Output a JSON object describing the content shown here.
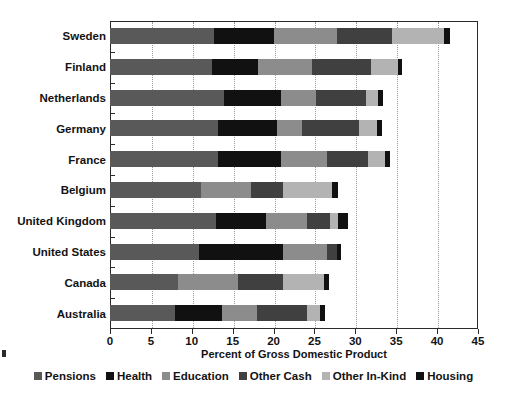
{
  "chart_data": {
    "type": "bar",
    "orientation": "horizontal",
    "stacked": true,
    "title": "",
    "xlabel": "Percent of Gross Domestic Product",
    "ylabel": "",
    "xlim": [
      0,
      45
    ],
    "xticks": [
      0,
      5,
      10,
      15,
      20,
      25,
      30,
      35,
      40,
      45
    ],
    "grid": "vertical-dotted",
    "legend_position": "bottom",
    "categories": [
      "Sweden",
      "Finland",
      "Netherlands",
      "Germany",
      "France",
      "Belgium",
      "United Kingdom",
      "United States",
      "Canada",
      "Australia"
    ],
    "series": [
      {
        "name": "Pensions",
        "color": "#595959",
        "values": [
          12.7,
          12.5,
          13.9,
          13.2,
          13.2,
          11.1,
          13.0,
          10.9,
          8.3,
          8.0
        ]
      },
      {
        "name": "Health",
        "color": "#111111",
        "values": [
          7.3,
          5.6,
          7.0,
          7.2,
          7.7,
          0.0,
          6.1,
          10.2,
          0.0,
          5.7
        ]
      },
      {
        "name": "Education",
        "color": "#8c8c8c",
        "values": [
          7.8,
          6.6,
          4.3,
          3.1,
          5.6,
          6.1,
          5.0,
          5.4,
          7.3,
          4.3
        ]
      },
      {
        "name": "Other Cash",
        "color": "#404040",
        "values": [
          6.7,
          7.2,
          6.1,
          7.0,
          5.0,
          3.9,
          2.8,
          1.3,
          5.6,
          6.1
        ]
      },
      {
        "name": "Other In-Kind",
        "color": "#b3b3b3",
        "values": [
          6.4,
          3.3,
          1.5,
          2.2,
          2.1,
          6.0,
          1.0,
          0.0,
          5.0,
          1.6
        ]
      },
      {
        "name": "Housing",
        "color": "#111111",
        "values": [
          0.7,
          0.5,
          0.6,
          0.6,
          0.6,
          0.8,
          1.2,
          0.4,
          0.6,
          0.6
        ]
      }
    ],
    "totals": [
      41.6,
      35.7,
      33.4,
      33.3,
      34.2,
      27.9,
      29.1,
      28.2,
      26.8,
      26.3
    ]
  },
  "axis": {
    "x_title": "Percent of Gross Domestic Product",
    "tick_labels": [
      "0",
      "5",
      "10",
      "15",
      "20",
      "25",
      "30",
      "35",
      "40",
      "45"
    ]
  },
  "legend": {
    "items": [
      {
        "label": "Pensions",
        "color": "#595959"
      },
      {
        "label": "Health",
        "color": "#111111"
      },
      {
        "label": "Education",
        "color": "#8c8c8c"
      },
      {
        "label": "Other Cash",
        "color": "#404040"
      },
      {
        "label": "Other In-Kind",
        "color": "#b3b3b3"
      },
      {
        "label": "Housing",
        "color": "#111111"
      }
    ]
  }
}
